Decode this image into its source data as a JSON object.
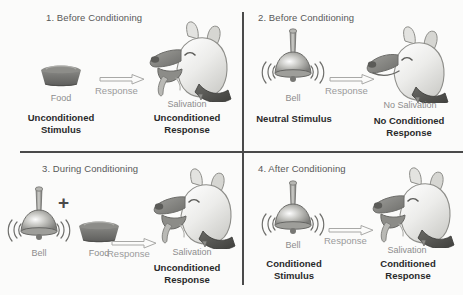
{
  "diagram": {
    "background_color": "#fbfbfa",
    "divider_color": "#4a4a4a",
    "light_text_color": "#8d8d8d",
    "bold_text_color": "#2a2a2a"
  },
  "panels": [
    {
      "id": "panel-1",
      "number": "1.",
      "title": "1. Before Conditioning",
      "stimulus_icon": "food-bowl-icon",
      "stimulus_caption": "Food",
      "stimulus_label_line1": "Unconditioned",
      "stimulus_label_line2": "Stimulus",
      "arrow_label": "Response",
      "subject_icon": "dog-head-salivating-icon",
      "response_caption": "Salivation",
      "response_label_line1": "Unconditioned",
      "response_label_line2": "Response"
    },
    {
      "id": "panel-2",
      "number": "2.",
      "title": "2. Before Conditioning",
      "stimulus_icon": "bell-icon",
      "stimulus_caption": "Bell",
      "stimulus_label_line1": "Neutral Stimulus",
      "stimulus_label_line2": "",
      "arrow_label": "Response",
      "subject_icon": "dog-head-not-salivating-icon",
      "response_caption": "No Salivation",
      "response_label_line1": "No Conditioned",
      "response_label_line2": "Response"
    },
    {
      "id": "panel-3",
      "number": "3.",
      "title": "3. During Conditioning",
      "stimulus_icon_a": "bell-icon",
      "stimulus_icon_b": "food-bowl-icon",
      "combiner": "+",
      "stimulus_caption_a": "Bell",
      "stimulus_caption_b": "Food",
      "arrow_label": "Response",
      "subject_icon": "dog-head-salivating-icon",
      "response_caption": "Salivation",
      "response_label_line1": "Unconditioned",
      "response_label_line2": "Response"
    },
    {
      "id": "panel-4",
      "number": "4.",
      "title": "4. After Conditioning",
      "stimulus_icon": "bell-icon",
      "stimulus_caption": "Bell",
      "stimulus_label_line1": "Conditioned",
      "stimulus_label_line2": "Stimulus",
      "arrow_label": "Response",
      "subject_icon": "dog-head-salivating-icon",
      "response_caption": "Salivation",
      "response_label_line1": "Conditioned",
      "response_label_line2": "Response"
    }
  ]
}
